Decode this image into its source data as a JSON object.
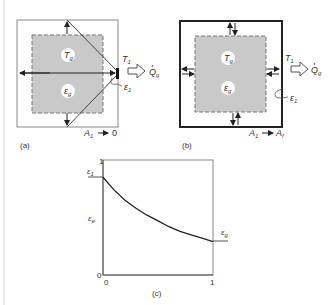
{
  "figure": {
    "panel_a": {
      "caption": "(a)",
      "gas_temperature": "T",
      "gas_temperature_sub": "g",
      "gas_emissivity": "ε",
      "gas_emissivity_sub": "g",
      "wall_temperature": "T",
      "wall_temperature_sub": "1",
      "heat_flow": "Q",
      "heat_flow_sub": "g",
      "wall_emissivity": "ε",
      "wall_emissivity_sub": "1",
      "area_limit_var": "A",
      "area_limit_sub": "1",
      "area_limit_arrow": "→",
      "area_limit_value": "0"
    },
    "panel_b": {
      "caption": "(b)",
      "gas_temperature": "T",
      "gas_temperature_sub": "g",
      "gas_emissivity": "ε",
      "gas_emissivity_sub": "g",
      "wall_temperature": "T",
      "wall_temperature_sub": "1",
      "heat_flow": "Q",
      "heat_flow_sub": "g",
      "wall_emissivity": "ε",
      "wall_emissivity_sub": "1",
      "area_limit_var": "A",
      "area_limit_sub": "1",
      "area_limit_arrow": "→",
      "area_limit_value": "A",
      "area_limit_value_sub": "f"
    },
    "panel_c": {
      "caption": "(c)",
      "y_label": "ε",
      "y_label_sub": "e",
      "y_top_tick": "1",
      "y_bottom_tick": "0",
      "x_left_tick": "0",
      "x_right_tick": "1",
      "left_value_label": "ε",
      "left_value_label_sub": "1",
      "right_value_label": "ε",
      "right_value_label_sub": "g"
    }
  },
  "chart_data": {
    "type": "line",
    "title": "(c)",
    "xlabel": "",
    "ylabel": "ε_e",
    "xlim": [
      0,
      1
    ],
    "ylim": [
      0,
      1
    ],
    "grid": false,
    "annotations": [
      {
        "text": "ε_1",
        "x": 0,
        "y": 0.85,
        "side": "left"
      },
      {
        "text": "ε_g",
        "x": 1,
        "y": 0.29,
        "side": "right"
      }
    ],
    "series": [
      {
        "name": "ε_e",
        "x": [
          0,
          0.1,
          0.2,
          0.3,
          0.4,
          0.5,
          0.6,
          0.7,
          0.8,
          0.9,
          1.0
        ],
        "y": [
          0.85,
          0.74,
          0.65,
          0.58,
          0.52,
          0.47,
          0.42,
          0.38,
          0.35,
          0.32,
          0.29
        ]
      }
    ]
  }
}
